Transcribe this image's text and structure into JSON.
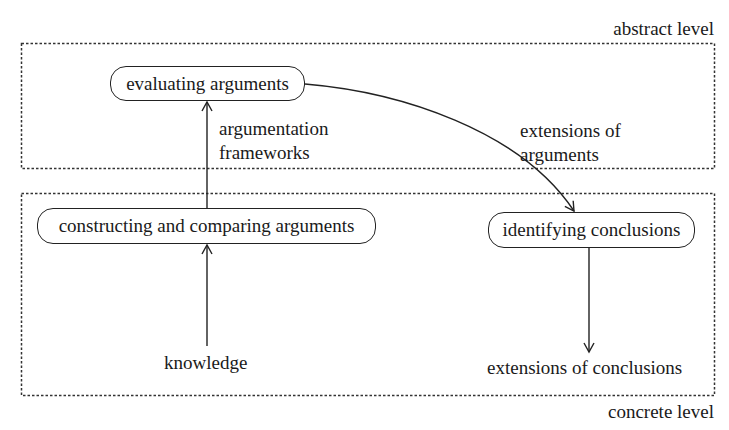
{
  "levels": {
    "abstract": "abstract level",
    "concrete": "concrete level"
  },
  "nodes": {
    "evaluating": "evaluating arguments",
    "constructing": "constructing and comparing arguments",
    "identifying": "identifying conclusions"
  },
  "labels": {
    "argumentation_frameworks_line1": "argumentation",
    "argumentation_frameworks_line2": "frameworks",
    "extensions_arguments_line1": "extensions of",
    "extensions_arguments_line2": "arguments",
    "knowledge": "knowledge",
    "extensions_conclusions": "extensions of conclusions"
  },
  "edges": [
    {
      "from": "knowledge",
      "to": "constructing and comparing arguments"
    },
    {
      "from": "constructing and comparing arguments",
      "to": "evaluating arguments",
      "label": "argumentation frameworks"
    },
    {
      "from": "evaluating arguments",
      "to": "identifying conclusions",
      "label": "extensions of arguments"
    },
    {
      "from": "identifying conclusions",
      "to": "extensions of conclusions"
    }
  ]
}
